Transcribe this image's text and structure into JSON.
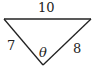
{
  "diagram": {
    "type": "triangle",
    "stroke_color": "#222222",
    "background": "#ffffff",
    "vertices": {
      "top_left": [
        4,
        19
      ],
      "top_right": [
        91,
        19
      ],
      "bottom": [
        43,
        65
      ]
    },
    "sides": {
      "top": "10",
      "left": "7",
      "right": "8"
    },
    "angle": {
      "label": "θ",
      "vertex": "bottom"
    }
  }
}
